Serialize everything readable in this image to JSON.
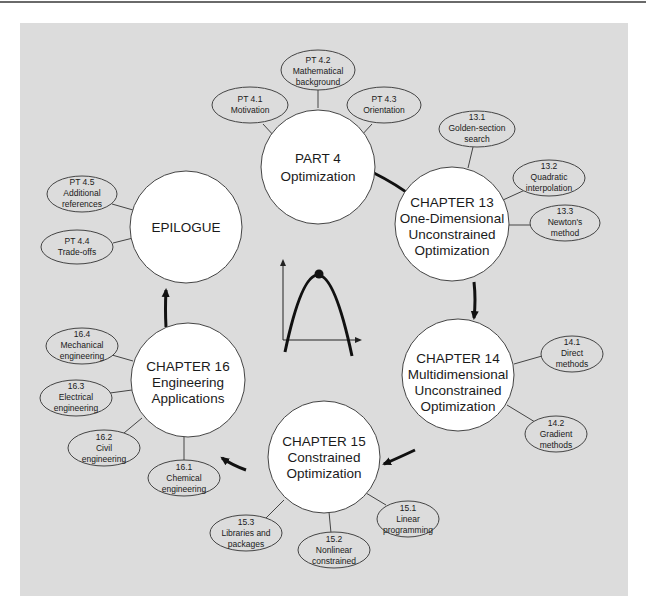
{
  "diagram": {
    "type": "concept-map",
    "colors": {
      "panel": "#dcdcdc",
      "circle_fill": "#ffffff",
      "stroke": "#333333",
      "arrow": "#111111",
      "top_rule": "#6a6a6a"
    },
    "main_nodes": [
      {
        "id": "part4",
        "lines": [
          "PART 4",
          "Optimization"
        ]
      },
      {
        "id": "ch13",
        "lines": [
          "CHAPTER 13",
          "One-Dimensional",
          "Unconstrained",
          "Optimization"
        ]
      },
      {
        "id": "ch14",
        "lines": [
          "CHAPTER 14",
          "Multidimensional",
          "Unconstrained",
          "Optimization"
        ]
      },
      {
        "id": "ch15",
        "lines": [
          "CHAPTER 15",
          "Constrained",
          "Optimization"
        ]
      },
      {
        "id": "ch16",
        "lines": [
          "CHAPTER 16",
          "Engineering",
          "Applications"
        ]
      },
      {
        "id": "epilogue",
        "lines": [
          "EPILOGUE"
        ]
      }
    ],
    "sub_nodes": [
      {
        "id": "pt41",
        "parent": "part4",
        "lines": [
          "PT 4.1",
          "Motivation"
        ]
      },
      {
        "id": "pt42",
        "parent": "part4",
        "lines": [
          "PT 4.2",
          "Mathematical",
          "background"
        ]
      },
      {
        "id": "pt43",
        "parent": "part4",
        "lines": [
          "PT 4.3",
          "Orientation"
        ]
      },
      {
        "id": "s131",
        "parent": "ch13",
        "lines": [
          "13.1",
          "Golden-section",
          "search"
        ]
      },
      {
        "id": "s132",
        "parent": "ch13",
        "lines": [
          "13.2",
          "Quadratic",
          "interpolation"
        ]
      },
      {
        "id": "s133",
        "parent": "ch13",
        "lines": [
          "13.3",
          "Newton's",
          "method"
        ]
      },
      {
        "id": "s141",
        "parent": "ch14",
        "lines": [
          "14.1",
          "Direct",
          "methods"
        ]
      },
      {
        "id": "s142",
        "parent": "ch14",
        "lines": [
          "14.2",
          "Gradient",
          "methods"
        ]
      },
      {
        "id": "s151",
        "parent": "ch15",
        "lines": [
          "15.1",
          "Linear",
          "programming"
        ]
      },
      {
        "id": "s152",
        "parent": "ch15",
        "lines": [
          "15.2",
          "Nonlinear",
          "constrained"
        ]
      },
      {
        "id": "s153",
        "parent": "ch15",
        "lines": [
          "15.3",
          "Libraries and",
          "packages"
        ]
      },
      {
        "id": "s161",
        "parent": "ch16",
        "lines": [
          "16.1",
          "Chemical",
          "engineering"
        ]
      },
      {
        "id": "s162",
        "parent": "ch16",
        "lines": [
          "16.2",
          "Civil",
          "engineering"
        ]
      },
      {
        "id": "s163",
        "parent": "ch16",
        "lines": [
          "16.3",
          "Electrical",
          "engineering"
        ]
      },
      {
        "id": "s164",
        "parent": "ch16",
        "lines": [
          "16.4",
          "Mechanical",
          "engineering"
        ]
      },
      {
        "id": "pt44",
        "parent": "epilogue",
        "lines": [
          "PT 4.4",
          "Trade-offs"
        ]
      },
      {
        "id": "pt45",
        "parent": "epilogue",
        "lines": [
          "PT 4.5",
          "Additional",
          "references"
        ]
      }
    ],
    "flow": [
      "part4",
      "ch13",
      "ch14",
      "ch15",
      "ch16",
      "epilogue"
    ],
    "center_icon": "parabola-maximum-icon"
  }
}
